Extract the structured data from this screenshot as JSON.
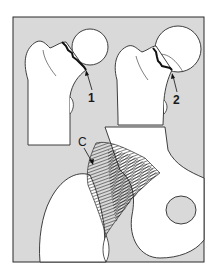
{
  "figure": {
    "background_color": "#d9d9d9",
    "line_color": "#2a2a2a",
    "bone_fill": "#ffffff",
    "labels": [
      {
        "id": "label-1",
        "text": "1",
        "x": 88,
        "y": 92
      },
      {
        "id": "label-2",
        "text": "2",
        "x": 173,
        "y": 94
      },
      {
        "id": "label-c",
        "text": "C",
        "x": 78,
        "y": 136
      }
    ]
  }
}
